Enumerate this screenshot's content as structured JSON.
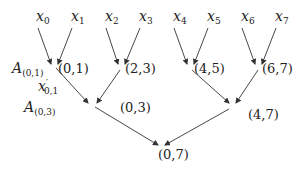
{
  "diagram": {
    "type": "binary reduction tree",
    "leaves": [
      {
        "base": "x",
        "sub": "0"
      },
      {
        "base": "x",
        "sub": "1"
      },
      {
        "base": "x",
        "sub": "2"
      },
      {
        "base": "x",
        "sub": "3"
      },
      {
        "base": "x",
        "sub": "4"
      },
      {
        "base": "x",
        "sub": "5"
      },
      {
        "base": "x",
        "sub": "6"
      },
      {
        "base": "x",
        "sub": "7"
      }
    ],
    "level1": [
      "(0,1)",
      "(2,3)",
      "(4,5)",
      "(6,7)"
    ],
    "level2": [
      "(0,3)",
      "(4,7)"
    ],
    "root": "(0,7)",
    "annotations": {
      "a01": {
        "base": "A",
        "sub": "(0,1)"
      },
      "xprime": {
        "base": "x",
        "prime": "′",
        "sub": "0,1"
      },
      "a03": {
        "base": "A",
        "sub": "(0,3)"
      }
    },
    "edge_color": "#333333"
  }
}
